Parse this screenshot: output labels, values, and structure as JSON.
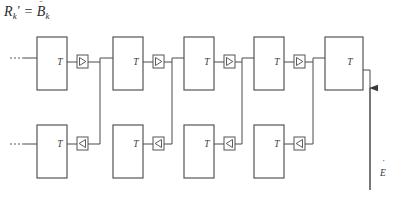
{
  "figure": {
    "width": 395,
    "height": 199,
    "background": "#ffffff",
    "line_color": "#4a4a4a",
    "block_stroke": "#555555",
    "text_color": "#3a3a3a"
  },
  "formula": {
    "lhs_symbol": "R",
    "lhs_subscript": "k",
    "lhs_prime": "′",
    "equals": "=",
    "rhs_symbol": "B",
    "rhs_subscript": "k",
    "rhs_accent": "̈"
  },
  "labels": {
    "block_label": "T",
    "output_label": "E",
    "output_accent": "˙",
    "ellipsis": "···"
  },
  "top_row": {
    "count": 5,
    "block_y": 37,
    "block_height": 53,
    "block_width": 30,
    "amp_y": 62,
    "blocks": [
      {
        "index": 0,
        "x": 37,
        "label": "T",
        "amp_x": 77,
        "amp_direction": "right"
      },
      {
        "index": 1,
        "x": 113,
        "label": "T",
        "amp_x": 153,
        "amp_direction": "right"
      },
      {
        "index": 2,
        "x": 184,
        "label": "T",
        "amp_x": 224,
        "amp_direction": "right"
      },
      {
        "index": 3,
        "x": 254,
        "label": "T",
        "amp_x": 294,
        "amp_direction": "right"
      },
      {
        "index": 4,
        "x": 325,
        "label": "T",
        "amp_x": null,
        "amp_direction": null
      }
    ]
  },
  "bottom_row": {
    "count": 4,
    "block_y": 125,
    "block_height": 53,
    "block_width": 30,
    "amp_y": 144,
    "blocks": [
      {
        "index": 0,
        "x": 37,
        "label": "T",
        "amp_x": 77,
        "amp_direction": "left"
      },
      {
        "index": 1,
        "x": 113,
        "label": "T",
        "amp_x": 153,
        "amp_direction": "left"
      },
      {
        "index": 2,
        "x": 184,
        "label": "T",
        "amp_x": 224,
        "amp_direction": "left"
      },
      {
        "index": 3,
        "x": 254,
        "label": "T",
        "amp_x": 294,
        "amp_direction": "left"
      }
    ]
  },
  "input_leads": {
    "top": {
      "y": 58,
      "x_start": 10,
      "x_end": 37
    },
    "bottom": {
      "y": 144,
      "x_start": 10,
      "x_end": 37
    }
  },
  "output_arrow": {
    "x": 370,
    "y_top": 86,
    "y_bottom": 190,
    "direction": "up",
    "label": "E"
  }
}
